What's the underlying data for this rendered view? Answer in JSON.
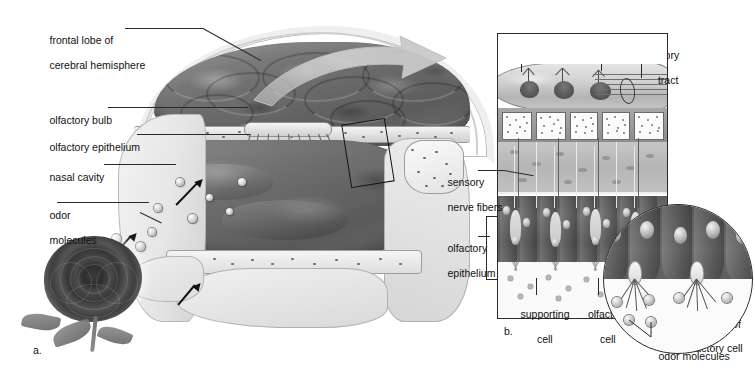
{
  "figure": {
    "background_color": "#ffffff",
    "ink_color": "#1a1a1a"
  },
  "panel_a": {
    "letter": "a.",
    "labels": [
      {
        "id": "frontal-lobe",
        "line1": "frontal lobe of",
        "line2": "cerebral hemisphere"
      },
      {
        "id": "olfactory-bulb",
        "line1": "olfactory bulb",
        "line2": ""
      },
      {
        "id": "olfactory-epithelium",
        "line1": "olfactory epithelium",
        "line2": ""
      },
      {
        "id": "nasal-cavity",
        "line1": "nasal cavity",
        "line2": ""
      },
      {
        "id": "odor-molecules",
        "line1": "odor",
        "line2": "molecules"
      }
    ],
    "inset_box_note": "boxed region of olfactory epithelium enlarged in b",
    "rose_note": "photograph of a rose as the odor source"
  },
  "panel_b": {
    "letter": "b.",
    "labels": [
      {
        "id": "olfactory-bulb",
        "line1": "olfactory bulb",
        "line2": ""
      },
      {
        "id": "neuron",
        "line1": "neuron",
        "line2": ""
      },
      {
        "id": "olfactory-tract",
        "line1": "olfactory",
        "line2": "tract"
      },
      {
        "id": "sensory-nerve-fibers",
        "line1": "sensory",
        "line2": "nerve fibers"
      },
      {
        "id": "olfactory-epithelium",
        "line1": "olfactory",
        "line2": "epithelium"
      },
      {
        "id": "supporting-cell",
        "line1": "supporting",
        "line2": "cell"
      },
      {
        "id": "olfactory-cell",
        "line1": "olfactory",
        "line2": "cell"
      }
    ],
    "inset": {
      "labels": [
        {
          "id": "olfactory-cilia",
          "line1": "olfactory cilia of",
          "line2": "olfactory cell"
        },
        {
          "id": "odor-molecules",
          "line1": "odor molecules",
          "line2": ""
        }
      ]
    }
  }
}
